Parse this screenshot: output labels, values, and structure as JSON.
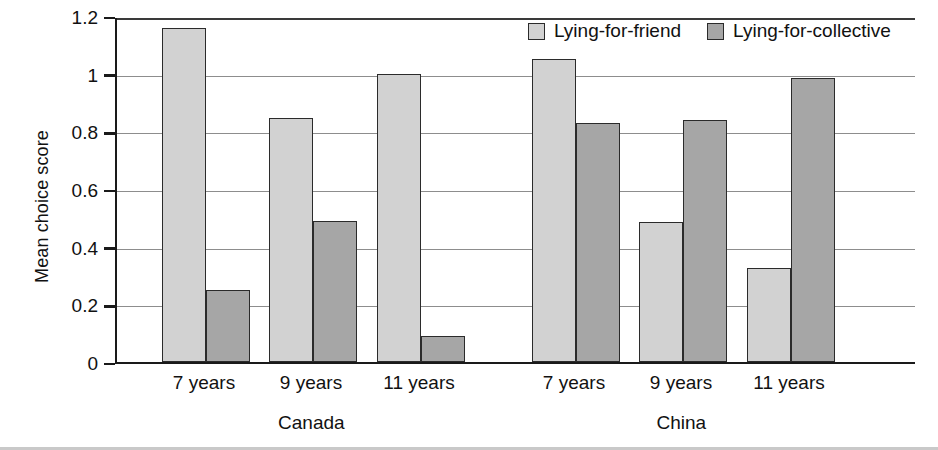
{
  "chart_data": {
    "type": "bar",
    "title": "",
    "xlabel": "",
    "ylabel": "Mean choice score",
    "ylim": [
      0,
      1.2
    ],
    "ytick_values": [
      0,
      0.2,
      0.4,
      0.6,
      0.8,
      1,
      1.2
    ],
    "ytick_labels": [
      "0",
      "0.2",
      "0.4",
      "0.6",
      "0.8",
      "1",
      "1.2"
    ],
    "grid": "horizontal",
    "legend_position": "top-right",
    "categories": [
      "7 years",
      "9 years",
      "11 years",
      "7 years",
      "9 years",
      "11 years"
    ],
    "groups": [
      {
        "name": "Canada",
        "categories": [
          "7 years",
          "9 years",
          "11 years"
        ]
      },
      {
        "name": "China",
        "categories": [
          "7 years",
          "9 years",
          "11 years"
        ]
      }
    ],
    "series": [
      {
        "name": "Lying-for-friend",
        "color": "#d2d2d2",
        "values": [
          1.16,
          0.845,
          1.0,
          1.05,
          0.485,
          0.325
        ]
      },
      {
        "name": "Lying-for-collective",
        "color": "#a6a6a6",
        "values": [
          0.25,
          0.49,
          0.09,
          0.83,
          0.84,
          0.985
        ]
      }
    ]
  },
  "axis": {
    "y_title": "Mean choice score"
  },
  "legend": {
    "items": [
      {
        "label": "Lying-for-friend"
      },
      {
        "label": "Lying-for-collective"
      }
    ]
  },
  "colors": {
    "friend": "#d2d2d2",
    "collective": "#a6a6a6",
    "axis": "#1a1a1a",
    "grid": "#8d8d8d"
  }
}
